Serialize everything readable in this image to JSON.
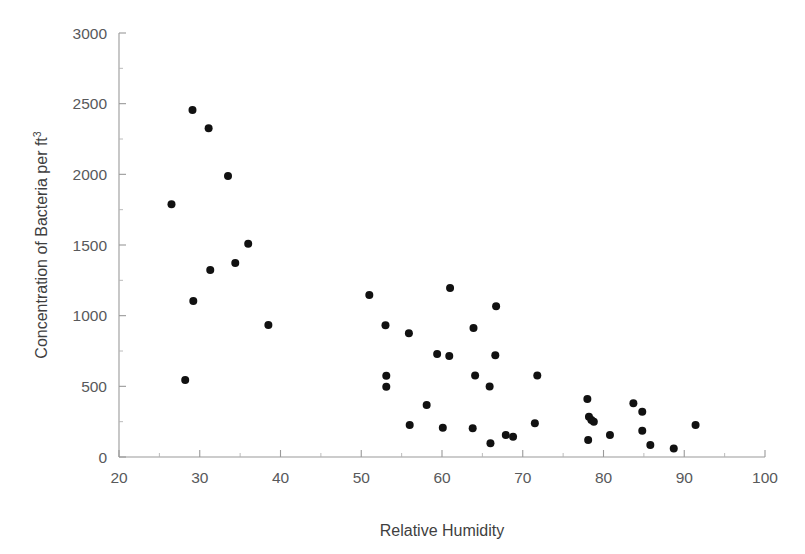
{
  "chart_data": {
    "type": "scatter",
    "title": "",
    "xlabel": "Relative Humidity",
    "ylabel": "Concentration of Bacteria per ft",
    "ylabel_superscript": "3",
    "xlim": [
      20,
      100
    ],
    "ylim": [
      0,
      3000
    ],
    "xticks": [
      20,
      30,
      40,
      50,
      60,
      70,
      80,
      90,
      100
    ],
    "yticks": [
      0,
      500,
      1000,
      1500,
      2000,
      2500,
      3000
    ],
    "xtick_labels": [
      "20",
      "30",
      "40",
      "50",
      "60",
      "70",
      "80",
      "90",
      "100"
    ],
    "ytick_labels": [
      "0",
      "500",
      "1000",
      "1500",
      "2000",
      "2500",
      "3000"
    ],
    "x_minor_step": 5,
    "y_minor_step": 250,
    "grid": false,
    "legend": null,
    "marker": "filled-circle",
    "marker_color": "#111111",
    "marker_size_px": 8,
    "axis_color": "#9a9a9a",
    "background_color": "#ffffff",
    "points": [
      {
        "x": 26.5,
        "y": 1789
      },
      {
        "x": 28.2,
        "y": 545
      },
      {
        "x": 29.1,
        "y": 2455
      },
      {
        "x": 29.2,
        "y": 1104
      },
      {
        "x": 31.1,
        "y": 2326
      },
      {
        "x": 31.3,
        "y": 1323
      },
      {
        "x": 33.5,
        "y": 1989
      },
      {
        "x": 34.4,
        "y": 1372
      },
      {
        "x": 36.0,
        "y": 1508
      },
      {
        "x": 38.5,
        "y": 934
      },
      {
        "x": 51.0,
        "y": 1147
      },
      {
        "x": 53.0,
        "y": 932
      },
      {
        "x": 53.1,
        "y": 575
      },
      {
        "x": 53.1,
        "y": 497
      },
      {
        "x": 55.9,
        "y": 875
      },
      {
        "x": 56.0,
        "y": 226
      },
      {
        "x": 58.1,
        "y": 368
      },
      {
        "x": 59.4,
        "y": 729
      },
      {
        "x": 60.1,
        "y": 207
      },
      {
        "x": 60.9,
        "y": 715
      },
      {
        "x": 61.0,
        "y": 1196
      },
      {
        "x": 63.8,
        "y": 203
      },
      {
        "x": 63.9,
        "y": 912
      },
      {
        "x": 64.1,
        "y": 576
      },
      {
        "x": 65.9,
        "y": 499
      },
      {
        "x": 66.0,
        "y": 97
      },
      {
        "x": 66.6,
        "y": 720
      },
      {
        "x": 66.7,
        "y": 1066
      },
      {
        "x": 67.9,
        "y": 155
      },
      {
        "x": 68.8,
        "y": 143
      },
      {
        "x": 71.5,
        "y": 238
      },
      {
        "x": 71.8,
        "y": 576
      },
      {
        "x": 78.0,
        "y": 410
      },
      {
        "x": 78.2,
        "y": 285
      },
      {
        "x": 78.5,
        "y": 262
      },
      {
        "x": 78.8,
        "y": 250
      },
      {
        "x": 78.1,
        "y": 120
      },
      {
        "x": 80.8,
        "y": 155
      },
      {
        "x": 83.7,
        "y": 380
      },
      {
        "x": 84.8,
        "y": 320
      },
      {
        "x": 84.8,
        "y": 186
      },
      {
        "x": 85.8,
        "y": 85
      },
      {
        "x": 88.7,
        "y": 61
      },
      {
        "x": 91.4,
        "y": 226
      }
    ]
  }
}
